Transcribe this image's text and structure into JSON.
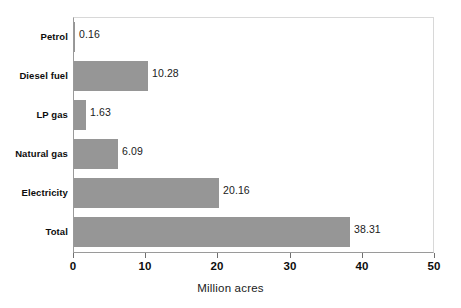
{
  "chart_data": {
    "type": "bar",
    "orientation": "horizontal",
    "title": "",
    "xlabel": "Million acres",
    "ylabel": "",
    "categories": [
      "Petrol",
      "Diesel fuel",
      "LP gas",
      "Natural gas",
      "Electricity",
      "Total"
    ],
    "values": [
      0.16,
      10.28,
      1.63,
      6.09,
      20.16,
      38.31
    ],
    "value_labels": [
      "0.16",
      "10.28",
      "1.63",
      "6.09",
      "20.16",
      "38.31"
    ],
    "xlim": [
      0,
      50
    ],
    "xticks": [
      0,
      10,
      20,
      30,
      40,
      50
    ],
    "xtick_labels": [
      "0",
      "10",
      "20",
      "30",
      "40",
      "50"
    ],
    "grid": false,
    "legend": false,
    "bar_color": "#969696",
    "axis_color": "#9a9a9a",
    "text_color": "#0d0d0d"
  }
}
